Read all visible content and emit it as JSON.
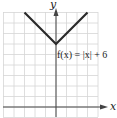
{
  "chart_data": {
    "type": "line",
    "title": "",
    "function_label": "f(x) = |x| + 6",
    "xlabel": "x",
    "ylabel": "y",
    "xlim": [
      -5,
      4
    ],
    "ylim": [
      -1,
      9
    ],
    "grid": true,
    "series": [
      {
        "name": "f(x) = |x| + 6",
        "x": [
          -3,
          0,
          3
        ],
        "y": [
          9,
          6,
          9
        ]
      }
    ],
    "colors": {
      "curve": "#2a2a2a",
      "axis": "#444444",
      "grid": "#d6d6d6"
    }
  },
  "labels": {
    "x_axis": "x",
    "y_axis": "y",
    "equation_prefix": "f(x) = |x| + 6"
  }
}
